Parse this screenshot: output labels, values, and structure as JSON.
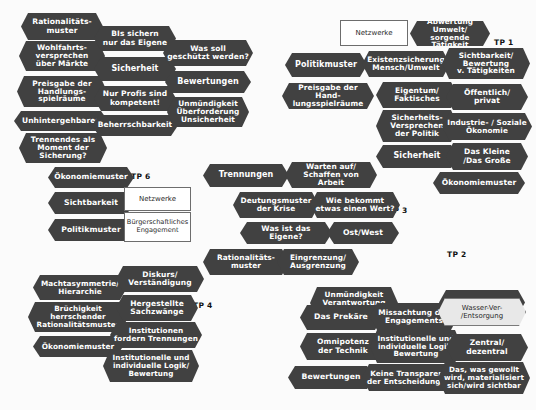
{
  "diagram": {
    "background_color": "#fbfbfb",
    "node_color": "#414141",
    "node_text_color": "#ffffff",
    "box_border_color": "#6d6d6d",
    "highlight_color": "#e8e8e8"
  },
  "group_labels": [
    {
      "id": "tp1",
      "text": "TP 1"
    },
    {
      "id": "tp2",
      "text": "TP 2"
    },
    {
      "id": "tp3",
      "text": "TP 3"
    },
    {
      "id": "tp4",
      "text": "TP 4"
    },
    {
      "id": "tp5",
      "text": "TP 5"
    },
    {
      "id": "tp6",
      "text": "TP 6"
    }
  ],
  "tp5": {
    "label": "TP 5",
    "nodes": [
      {
        "id": "tp5-n1",
        "text": "Rationalitäts-\nmuster"
      },
      {
        "id": "tp5-n2",
        "text": "Wohlfahrts-\nversprechen\nüber Märkte"
      },
      {
        "id": "tp5-n3",
        "text": "Preisgabe der\nHandlungs-\nspielräume"
      },
      {
        "id": "tp5-n4",
        "text": "Unhintergehbares"
      },
      {
        "id": "tp5-n5",
        "text": "Trennendes als\nMoment der\nSicherung?"
      },
      {
        "id": "tp5-n6",
        "text": "BIs sichern\nnur das Eigene"
      },
      {
        "id": "tp5-n7",
        "text": "Sicherheit"
      },
      {
        "id": "tp5-n8",
        "text": "Nur Profis sind\nkompetent!"
      },
      {
        "id": "tp5-n9",
        "text": "Beherrschbarkeit"
      },
      {
        "id": "tp5-n10",
        "text": "Was soll\ngeschützt werden?"
      },
      {
        "id": "tp5-n11",
        "text": "Bewertungen"
      },
      {
        "id": "tp5-n12",
        "text": "Unmündigkeit\nÜberforderung\nUnsicherheit"
      }
    ]
  },
  "tp1": {
    "label": "TP 1",
    "boxes": [
      {
        "id": "tp1-box1",
        "text": "Netzwerke"
      }
    ],
    "nodes": [
      {
        "id": "tp1-n1",
        "text": "Abwertung Umwelt/\nsorgende Tätigkeit"
      },
      {
        "id": "tp1-n2",
        "text": "Politikmuster"
      },
      {
        "id": "tp1-n3",
        "text": "Existenzsicherung\nMensch/Umwelt"
      },
      {
        "id": "tp1-n4",
        "text": "Sichtbarkeit/\nBewertung\nv. Tätigkeiten"
      },
      {
        "id": "tp1-n5",
        "text": "Preisgabe der Hand-\nlungsspielräume"
      },
      {
        "id": "tp1-n6",
        "text": "Eigentum/\nFaktisches"
      },
      {
        "id": "tp1-n7",
        "text": "Öffentlich/\nprivat"
      },
      {
        "id": "tp1-n8",
        "text": "Sicherheits-\nVersprechen\nder Politik"
      },
      {
        "id": "tp1-n9",
        "text": "Industrie- / Soziale\nÖkonomie"
      },
      {
        "id": "tp1-n10",
        "text": "Sicherheit"
      },
      {
        "id": "tp1-n11",
        "text": "Das Kleine\n/Das Große"
      },
      {
        "id": "tp1-n12",
        "text": "Ökonomiemuster"
      }
    ]
  },
  "tp6": {
    "label": "TP 6",
    "boxes": [
      {
        "id": "tp6-box1",
        "text": "Netzwerke"
      },
      {
        "id": "tp6-box2",
        "text": "Bürgerschaftliches\nEngagement"
      }
    ],
    "nodes": [
      {
        "id": "tp6-n1",
        "text": "Ökonomiemuster"
      },
      {
        "id": "tp6-n2",
        "text": "Sichtbarkeit"
      },
      {
        "id": "tp6-n3",
        "text": "Politikmuster"
      }
    ]
  },
  "tp3": {
    "label": "TP 3",
    "nodes": [
      {
        "id": "tp3-n1",
        "text": "Trennungen"
      },
      {
        "id": "tp3-n2",
        "text": "Warten auf/\nSchaffen von Arbeit"
      },
      {
        "id": "tp3-n3",
        "text": "Deutungsmuster\nder Krise"
      },
      {
        "id": "tp3-n4",
        "text": "Wie bekommt\netwas einen Wert?"
      },
      {
        "id": "tp3-n5",
        "text": "Was ist das Eigene?"
      },
      {
        "id": "tp3-n6",
        "text": "Ost/West"
      },
      {
        "id": "tp3-n7",
        "text": "Rationalitäts-\nmuster"
      },
      {
        "id": "tp3-n8",
        "text": "Eingrenzung/\nAusgrenzung"
      }
    ]
  },
  "tp4": {
    "label": "TP 4",
    "nodes": [
      {
        "id": "tp4-n1",
        "text": "Machtasymmetrie/\nHierarchie"
      },
      {
        "id": "tp4-n2",
        "text": "Brüchigkeit\nherrschender\nRationalitätsmuster"
      },
      {
        "id": "tp4-n3",
        "text": "Ökonomiemuster"
      },
      {
        "id": "tp4-n4",
        "text": "Diskurs/\nVerständigung"
      },
      {
        "id": "tp4-n5",
        "text": "Hergestellte\nSachzwänge"
      },
      {
        "id": "tp4-n6",
        "text": "Institutionen\nfordern Trennungen"
      },
      {
        "id": "tp4-n7",
        "text": "Institutionelle und\nindividuelle Logik/\nBewertung"
      }
    ]
  },
  "tp2": {
    "label": "TP 2",
    "highlight_nodes": [
      {
        "id": "tp2-h1",
        "text": "Wasser-Ver-\n/Entsorgung"
      }
    ],
    "nodes": [
      {
        "id": "tp2-n1",
        "text": "Unmündigkeit\nVerantwortung\nOhnmacht"
      },
      {
        "id": "tp2-n2",
        "text": "Trennungen"
      },
      {
        "id": "tp2-n3",
        "text": "Das Prekäre"
      },
      {
        "id": "tp2-n4",
        "text": "Missachtung des\nEngagements"
      },
      {
        "id": "tp2-n5",
        "text": "Omnipotenz\nder Technik"
      },
      {
        "id": "tp2-n6",
        "text": "Institutionelle und\nindividuelle Logik/\nBewertung"
      },
      {
        "id": "tp2-n7",
        "text": "Zentral/\ndezentral"
      },
      {
        "id": "tp2-n8",
        "text": "Bewertungen"
      },
      {
        "id": "tp2-n9",
        "text": "Keine Transparenz\nder Entscheidungen"
      },
      {
        "id": "tp2-n10",
        "text": "Das, was gewollt\nwird, materialisiert\nsich/wird sichtbar"
      }
    ]
  }
}
